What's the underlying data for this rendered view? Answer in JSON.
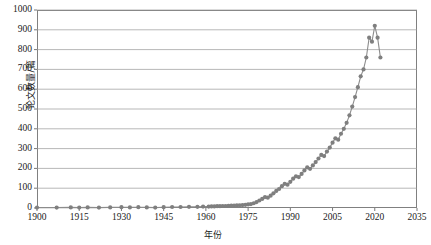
{
  "chart_data": {
    "type": "scatter",
    "title": "",
    "xlabel": "年份",
    "ylabel": "论文数量/篇",
    "xlim": [
      1900,
      2035
    ],
    "ylim": [
      0,
      1000
    ],
    "xticks": [
      1900,
      1915,
      1930,
      1945,
      1960,
      1975,
      1990,
      2005,
      2020,
      2035
    ],
    "yticks": [
      0,
      100,
      200,
      300,
      400,
      500,
      600,
      700,
      800,
      900,
      1000
    ],
    "grid": "horizontal",
    "legend": "none",
    "marker_color": "#7f7f7f",
    "line_color": "#8c8c8c",
    "series": [
      {
        "name": "论文数量",
        "x": [
          1900,
          1907,
          1912,
          1915,
          1918,
          1922,
          1926,
          1930,
          1933,
          1936,
          1939,
          1942,
          1945,
          1948,
          1951,
          1954,
          1957,
          1959,
          1961,
          1962,
          1963,
          1964,
          1965,
          1966,
          1967,
          1968,
          1969,
          1970,
          1971,
          1972,
          1973,
          1974,
          1975,
          1976,
          1977,
          1978,
          1979,
          1980,
          1981,
          1982,
          1983,
          1984,
          1985,
          1986,
          1987,
          1988,
          1989,
          1990,
          1991,
          1992,
          1993,
          1994,
          1995,
          1996,
          1997,
          1998,
          1999,
          2000,
          2001,
          2002,
          2003,
          2004,
          2005,
          2006,
          2007,
          2008,
          2009,
          2010,
          2011,
          2012,
          2013,
          2014,
          2015,
          2016,
          2017,
          2018,
          2019,
          2020,
          2021,
          2022
        ],
        "y": [
          2,
          2,
          3,
          2,
          3,
          2,
          3,
          4,
          3,
          4,
          3,
          2,
          4,
          5,
          5,
          6,
          6,
          7,
          7,
          8,
          8,
          9,
          9,
          10,
          10,
          11,
          12,
          12,
          13,
          14,
          15,
          16,
          18,
          20,
          24,
          30,
          38,
          46,
          55,
          52,
          62,
          74,
          86,
          96,
          110,
          122,
          118,
          132,
          148,
          160,
          156,
          172,
          190,
          205,
          198,
          215,
          232,
          250,
          268,
          262,
          285,
          305,
          330,
          352,
          345,
          375,
          400,
          430,
          468,
          512,
          560,
          610,
          665,
          700,
          760,
          860,
          840,
          920,
          860,
          760
        ]
      }
    ]
  },
  "axis": {
    "ytick_labels": [
      "1000",
      "900",
      "800",
      "700",
      "600",
      "500",
      "400",
      "300",
      "200",
      "100",
      "0"
    ],
    "xtick_labels": [
      "1900",
      "1915",
      "1930",
      "1945",
      "1960",
      "1975",
      "1990",
      "2005",
      "2020",
      "2035"
    ]
  }
}
